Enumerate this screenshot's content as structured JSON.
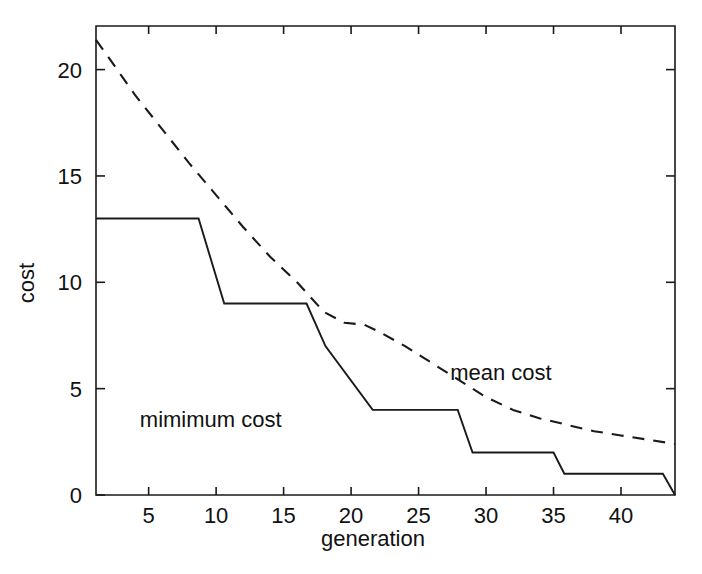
{
  "chart_data": {
    "type": "line",
    "title": "",
    "subtitle": "",
    "xlabel": "generation",
    "ylabel": "cost",
    "xlim": [
      1.1,
      44.0
    ],
    "ylim": [
      0,
      22.05
    ],
    "xticks": [
      5,
      10,
      15,
      20,
      25,
      30,
      35,
      40
    ],
    "xtick_labels": [
      "5",
      "10",
      "15",
      "20",
      "25",
      "30",
      "35",
      "40"
    ],
    "yticks": [
      0,
      5,
      10,
      15,
      20
    ],
    "ytick_labels": [
      "0",
      "5",
      "10",
      "15",
      "20"
    ],
    "grid": false,
    "legend_position": "inline-annotations",
    "series": [
      {
        "name": "mimimum cost",
        "style": "solid",
        "color": "#1a1a1a",
        "annotation": "mimimum cost",
        "annotation_x": 9.6,
        "annotation_y": 3.2,
        "x": [
          1.1,
          8.7,
          10.6,
          16.7,
          18.1,
          21.6,
          27.9,
          29.0,
          35.0,
          35.8,
          43.1,
          44.0
        ],
        "y": [
          13,
          13,
          9,
          9,
          7,
          4,
          4,
          2,
          2,
          1,
          1,
          0
        ]
      },
      {
        "name": "mean cost",
        "style": "dashed",
        "color": "#1a1a1a",
        "annotation": "mean cost",
        "annotation_x": 31.1,
        "annotation_y": 5.4,
        "x": [
          1.1,
          2.0,
          4.0,
          6.0,
          8.0,
          10.0,
          12.0,
          14.0,
          16.0,
          18.0,
          19.5,
          21.0,
          22.0,
          24.0,
          26.0,
          28.0,
          30.0,
          32.0,
          34.0,
          36.0,
          38.0,
          40.0,
          42.0,
          44.0
        ],
        "y": [
          21.4,
          20.6,
          18.8,
          17.2,
          15.6,
          14.1,
          12.6,
          11.2,
          10.0,
          8.6,
          8.1,
          8.0,
          7.7,
          7.0,
          6.2,
          5.4,
          4.6,
          4.0,
          3.6,
          3.3,
          3.0,
          2.8,
          2.6,
          2.4
        ]
      }
    ]
  },
  "axes": {
    "x_axis_label": "generation",
    "y_axis_label": "cost"
  },
  "annotations": {
    "minimum_cost_label": "mimimum cost",
    "mean_cost_label": "mean cost"
  },
  "colors": {
    "ink": "#1a1a1a",
    "background": "#ffffff"
  }
}
